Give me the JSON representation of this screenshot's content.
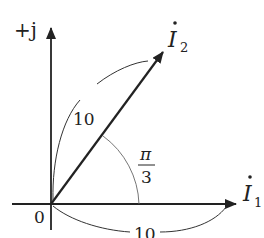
{
  "diagram": {
    "type": "phasor-diagram",
    "axes": {
      "imag_label": "+j",
      "origin_label": "0"
    },
    "phasors": [
      {
        "name": "I1",
        "symbol": "I",
        "subscript": "1",
        "magnitude": 10,
        "angle": "0"
      },
      {
        "name": "I2",
        "symbol": "I",
        "subscript": "2",
        "magnitude": 10,
        "angle": "π/3"
      }
    ],
    "magnitude_labels": {
      "i2": "10",
      "i1": "10"
    },
    "angle_label": {
      "numerator": "π",
      "denominator": "3"
    },
    "colors": {
      "line": "#222222",
      "thin_arc": "#555555",
      "background": "#ffffff"
    }
  }
}
